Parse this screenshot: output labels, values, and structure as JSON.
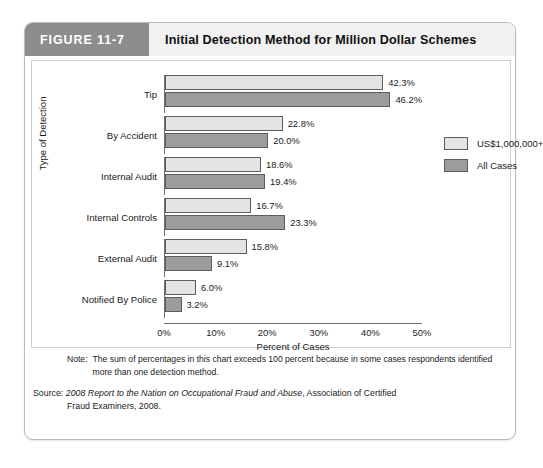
{
  "figure": {
    "tab_label": "FIGURE 11-7",
    "title": "Initial Detection Method for Million Dollar Schemes"
  },
  "notes": {
    "note_label": "Note:",
    "note_text": "The sum of percentages in this chart exceeds 100 percent because in some cases respondents identified more than one detection method.",
    "source_prefix": "Source: ",
    "source_italic": "2008 Report to the Nation on Occupational Fraud and Abuse",
    "source_rest": ", Association of Certified",
    "source_line2": "Fraud Examiners, 2008."
  },
  "chart_data": {
    "type": "bar",
    "orientation": "horizontal",
    "title": "Initial Detection Method for Million Dollar Schemes",
    "xlabel": "Percent of Cases",
    "ylabel": "Type of Detection",
    "xlim": [
      0,
      50
    ],
    "xticks": [
      "0%",
      "10%",
      "20%",
      "30%",
      "40%",
      "50%"
    ],
    "xtick_values": [
      0,
      10,
      20,
      30,
      40,
      50
    ],
    "grid": false,
    "legend_position": "right",
    "categories": [
      "Tip",
      "By Accident",
      "Internal Audit",
      "Internal Controls",
      "External Audit",
      "Notified By Police"
    ],
    "series": [
      {
        "name": "US$1,000,000+",
        "color": "#e4e4e4",
        "values": [
          42.3,
          22.8,
          18.6,
          16.7,
          15.8,
          6.0
        ],
        "labels": [
          "42.3%",
          "22.8%",
          "18.6%",
          "16.7%",
          "15.8%",
          "6.0%"
        ]
      },
      {
        "name": "All Cases",
        "color": "#9c9c9c",
        "values": [
          46.2,
          20.0,
          19.4,
          23.3,
          9.1,
          3.2
        ],
        "labels": [
          "46.2%",
          "20.0%",
          "19.4%",
          "23.3%",
          "9.1%",
          "3.2%"
        ]
      }
    ]
  }
}
